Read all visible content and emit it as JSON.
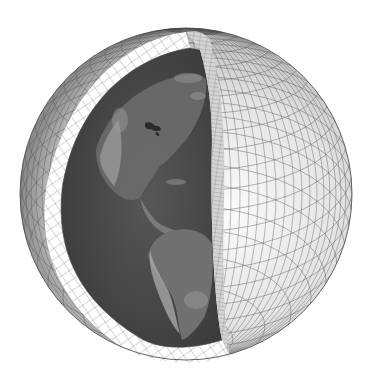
{
  "figure": {
    "subject": "Cutaway globe showing atmospheric model grid shell over Earth",
    "elements": {
      "outer_shell": "latitude-longitude grid shell",
      "cut_face_left": "gridded cross-section band",
      "cut_face_right": "gridded vertical cut face",
      "interior": "satellite Earth view of the Americas"
    },
    "colors": {
      "background": "#ffffff",
      "shell_light": "#f2f2f2",
      "shell_mid": "#c8c8c8",
      "shell_dark": "#6e6e6e",
      "grid_line": "#555555",
      "earth_ocean": "#4a4a4a",
      "earth_land": "#7a7a7a",
      "earth_land_light": "#a8a8a8",
      "cut_band": "#ffffff"
    }
  }
}
